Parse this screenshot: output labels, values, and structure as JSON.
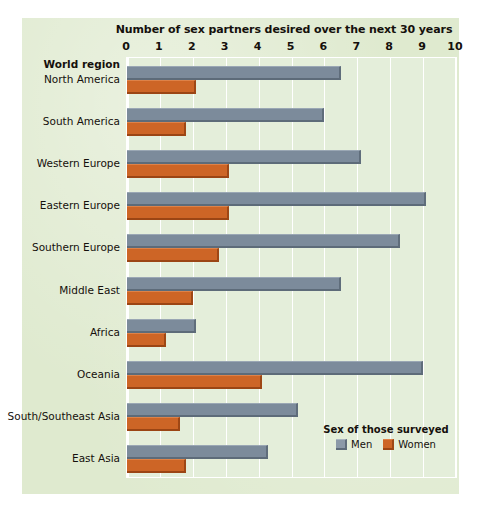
{
  "chart_data": {
    "type": "bar",
    "orientation": "horizontal",
    "title": "Number of sex partners desired over the next 30 years",
    "xlabel": "",
    "ylabel": "World region",
    "xlim": [
      0,
      10
    ],
    "xticks": [
      0,
      1,
      2,
      3,
      4,
      5,
      6,
      7,
      8,
      9,
      10
    ],
    "xtick_labels": [
      "0",
      "1",
      "2",
      "3",
      "4",
      "5",
      "6",
      "7",
      "8",
      "9",
      "10"
    ],
    "grid": true,
    "grid_axis": "x",
    "legend": {
      "title": "Sex of those surveyed",
      "position": "inside-bottom-right",
      "entries": [
        {
          "name": "Men",
          "color": "#7c8b9b"
        },
        {
          "name": "Women",
          "color": "#cd6526"
        }
      ]
    },
    "categories": [
      "North America",
      "South America",
      "Western Europe",
      "Eastern Europe",
      "Southern Europe",
      "Middle East",
      "Africa",
      "Oceania",
      "South/Southeast Asia",
      "East Asia"
    ],
    "series": [
      {
        "name": "Men",
        "color": "#7c8b9b",
        "values": [
          6.5,
          6.0,
          7.1,
          9.1,
          8.3,
          6.5,
          2.1,
          9.0,
          5.2,
          4.3
        ]
      },
      {
        "name": "Women",
        "color": "#cd6526",
        "values": [
          2.1,
          1.8,
          3.1,
          3.1,
          2.8,
          2.0,
          1.2,
          4.1,
          1.6,
          1.8
        ]
      }
    ]
  },
  "colors": {
    "panel_background": "#dfeacf",
    "plot_background": "#e4eeda",
    "gridline": "#ffffff",
    "text": "#15100c",
    "men_bar": "#7c8b9b",
    "women_bar": "#cd6526"
  }
}
